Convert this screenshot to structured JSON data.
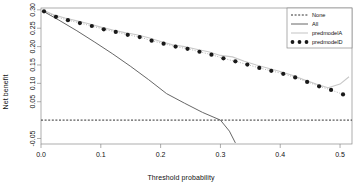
{
  "chart_data": {
    "type": "line",
    "title": "",
    "xlabel": "Threshold probability",
    "ylabel": "Net benefit",
    "xlim": [
      0.0,
      0.52
    ],
    "ylim": [
      -0.065,
      0.305
    ],
    "xticks": [
      0.0,
      0.1,
      0.2,
      0.3,
      0.4,
      0.5
    ],
    "xtick_labels": [
      "0.0",
      "0.1",
      "0.2",
      "0.3",
      "0.4",
      "0.5"
    ],
    "yticks": [
      -0.05,
      0.05,
      0.1,
      0.15,
      0.2,
      0.25,
      0.3
    ],
    "ytick_labels": [
      "-0.05",
      "0.05",
      "0.10",
      "0.15",
      "0.20",
      "0.25",
      "0.30"
    ],
    "grid": false,
    "legend_position": "top-right",
    "series": [
      {
        "name": "None",
        "style": "dashed",
        "color": "#1a1a1a",
        "x": [
          0.0,
          0.52
        ],
        "y": [
          0.0,
          0.0
        ]
      },
      {
        "name": "All",
        "style": "solid",
        "color": "#555555",
        "x": [
          0.005,
          0.03,
          0.06,
          0.09,
          0.12,
          0.15,
          0.18,
          0.21,
          0.24,
          0.27,
          0.3,
          0.315,
          0.325
        ],
        "y": [
          0.295,
          0.272,
          0.243,
          0.212,
          0.18,
          0.146,
          0.11,
          0.072,
          0.046,
          0.021,
          0.0,
          -0.03,
          -0.062
        ]
      },
      {
        "name": "predmodelA",
        "style": "solid-light",
        "color": "#c8c8c8",
        "x": [
          0.005,
          0.02,
          0.04,
          0.06,
          0.08,
          0.1,
          0.12,
          0.14,
          0.16,
          0.18,
          0.2,
          0.22,
          0.24,
          0.26,
          0.28,
          0.3,
          0.32,
          0.34,
          0.36,
          0.38,
          0.4,
          0.42,
          0.44,
          0.46,
          0.48,
          0.5,
          0.515
        ],
        "y": [
          0.298,
          0.287,
          0.278,
          0.27,
          0.262,
          0.253,
          0.245,
          0.238,
          0.232,
          0.224,
          0.214,
          0.205,
          0.2,
          0.193,
          0.186,
          0.176,
          0.172,
          0.16,
          0.15,
          0.141,
          0.132,
          0.122,
          0.11,
          0.098,
          0.088,
          0.098,
          0.118
        ]
      },
      {
        "name": "predmodelD",
        "style": "dots",
        "color": "#1a1a1a",
        "x": [
          0.005,
          0.025,
          0.045,
          0.065,
          0.085,
          0.105,
          0.125,
          0.145,
          0.165,
          0.185,
          0.205,
          0.225,
          0.245,
          0.265,
          0.285,
          0.305,
          0.325,
          0.345,
          0.365,
          0.385,
          0.405,
          0.425,
          0.445,
          0.465,
          0.485,
          0.505
        ],
        "y": [
          0.296,
          0.281,
          0.272,
          0.264,
          0.256,
          0.247,
          0.24,
          0.232,
          0.226,
          0.216,
          0.208,
          0.2,
          0.194,
          0.186,
          0.178,
          0.168,
          0.16,
          0.151,
          0.142,
          0.134,
          0.126,
          0.116,
          0.104,
          0.092,
          0.082,
          0.07
        ]
      }
    ],
    "legend": [
      {
        "label": "None",
        "marker": "dashed"
      },
      {
        "label": "All",
        "marker": "solid"
      },
      {
        "label": "predmodelA",
        "marker": "solid-light"
      },
      {
        "label": "predmodelD",
        "marker": "dots"
      }
    ]
  }
}
